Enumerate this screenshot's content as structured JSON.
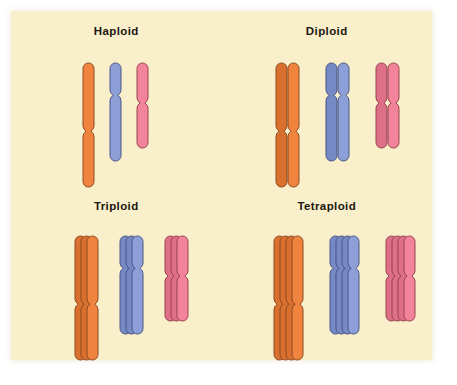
{
  "figure": {
    "background_color": "#f9efcb",
    "page_color": "#ffffff",
    "outline_color": "#7a4a23"
  },
  "chromosome_types": [
    {
      "name": "orange-chromosome",
      "fill": "#f0843f",
      "fill_shadow": "#d9702f",
      "outline": "#8a4a1e",
      "length": 124,
      "width": 11,
      "centromere_fraction": 0.55,
      "pinch": 3.0
    },
    {
      "name": "blue-chromosome",
      "fill": "#8ca0d7",
      "fill_shadow": "#7589c4",
      "outline": "#4a5585",
      "length": 98,
      "width": 11,
      "centromere_fraction": 0.33,
      "pinch": 3.0
    },
    {
      "name": "pink-chromosome",
      "fill": "#f2839a",
      "fill_shadow": "#dd6f86",
      "outline": "#97424f",
      "length": 85,
      "width": 11,
      "centromere_fraction": 0.47,
      "pinch": 3.0
    }
  ],
  "panels": [
    {
      "key": "haploid",
      "title": "Haploid",
      "copies": 1,
      "ploidy_notation": "n",
      "group_spacing": 27,
      "copy_offset_x": 9,
      "copy_offset_y": 0,
      "origin_x": 70,
      "origin_y": 50,
      "groups": [
        {
          "type": 0,
          "name": "haploid-orange-group"
        },
        {
          "type": 1,
          "name": "haploid-blue-group"
        },
        {
          "type": 2,
          "name": "haploid-pink-group"
        }
      ]
    },
    {
      "key": "diploid",
      "title": "Diploid",
      "copies": 2,
      "ploidy_notation": "2n",
      "group_spacing": 38,
      "copy_offset_x": 12,
      "copy_offset_y": 0,
      "origin_x": 52,
      "origin_y": 50,
      "groups": [
        {
          "type": 0,
          "name": "diploid-orange-group"
        },
        {
          "type": 1,
          "name": "diploid-blue-group"
        },
        {
          "type": 2,
          "name": "diploid-pink-group"
        }
      ]
    },
    {
      "key": "triploid",
      "title": "Triploid",
      "copies": 3,
      "ploidy_notation": "3n",
      "group_spacing": 33,
      "copy_offset_x": 6,
      "copy_offset_y": 0,
      "origin_x": 62,
      "origin_y": 48,
      "groups": [
        {
          "type": 0,
          "name": "triploid-orange-group"
        },
        {
          "type": 1,
          "name": "triploid-blue-group"
        },
        {
          "type": 2,
          "name": "triploid-pink-group"
        }
      ]
    },
    {
      "key": "tetraploid",
      "title": "Tetraploid",
      "copies": 4,
      "ploidy_notation": "4n",
      "group_spacing": 38,
      "copy_offset_x": 6,
      "copy_offset_y": 0,
      "origin_x": 50,
      "origin_y": 48,
      "groups": [
        {
          "type": 0,
          "name": "tetraploid-orange-group"
        },
        {
          "type": 1,
          "name": "tetraploid-blue-group"
        },
        {
          "type": 2,
          "name": "tetraploid-pink-group"
        }
      ]
    }
  ]
}
